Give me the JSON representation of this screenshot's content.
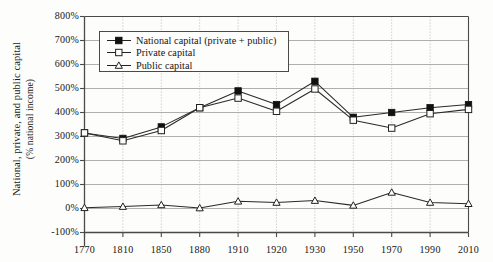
{
  "chart_data": {
    "type": "line",
    "title": "",
    "subtitle": "",
    "xlabel": "",
    "ylabel": "National, private, and public capital",
    "ylabel_line2": "(% national income)",
    "x": [
      1770,
      1810,
      1850,
      1880,
      1910,
      1920,
      1930,
      1950,
      1970,
      1990,
      2010
    ],
    "categories": [
      "1770",
      "1810",
      "1850",
      "1880",
      "1910",
      "1920",
      "1930",
      "1950",
      "1970",
      "1990",
      "2010"
    ],
    "ylim": [
      -100,
      800
    ],
    "yticks": [
      800,
      700,
      600,
      500,
      400,
      300,
      200,
      100,
      0,
      -100
    ],
    "ytick_labels": [
      "800%",
      "700%",
      "600%",
      "500%",
      "400%",
      "300%",
      "200%",
      "100%",
      "0%",
      "-100%"
    ],
    "grid": "horizontal solid, vertical dotted",
    "legend_position": "top-left inside",
    "series": [
      {
        "name": "National capital (private + public)",
        "marker": "filled-square",
        "values": [
          315,
          292,
          340,
          420,
          490,
          433,
          530,
          380,
          400,
          420,
          433
        ]
      },
      {
        "name": "Private capital",
        "marker": "open-square",
        "values": [
          315,
          282,
          325,
          420,
          460,
          405,
          498,
          368,
          335,
          395,
          413
        ]
      },
      {
        "name": "Public capital",
        "marker": "open-triangle",
        "values": [
          3,
          8,
          15,
          2,
          30,
          25,
          33,
          13,
          67,
          25,
          20
        ]
      }
    ]
  },
  "legend": {
    "items": [
      {
        "label": "National capital (private + public)",
        "marker": "filled-square-icon"
      },
      {
        "label": "Private capital",
        "marker": "open-square-icon"
      },
      {
        "label": "Public capital",
        "marker": "open-triangle-icon"
      }
    ]
  },
  "colors": {
    "axis": "#4a4a4a",
    "grid_solid": "#9a9a9a",
    "grid_dotted": "#b5b5b5",
    "line": "#2a2a2a",
    "background": "#fdfdfc",
    "text": "#161616"
  }
}
